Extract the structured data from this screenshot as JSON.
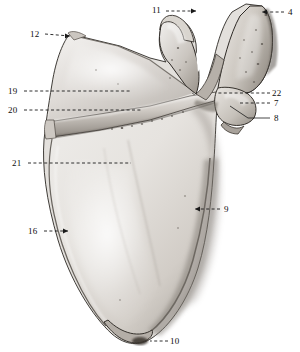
{
  "figure": {
    "background_color": "#ffffff",
    "width": 300,
    "height": 352,
    "label_color": "#0d0d0d",
    "leader_color": "#1a1a1a"
  },
  "labels": [
    {
      "id": "11",
      "text": "11",
      "x": 152,
      "y": 6,
      "leader": {
        "type": "dashed-arrow",
        "x1": 166,
        "y1": 11,
        "x2": 196,
        "y2": 11,
        "arrow": "right"
      }
    },
    {
      "id": "4",
      "text": "4",
      "x": 288,
      "y": 8,
      "leader": {
        "type": "dashed-arrow",
        "x1": 284,
        "y1": 12,
        "x2": 262,
        "y2": 12,
        "arrow": "left"
      }
    },
    {
      "id": "12",
      "text": "12",
      "x": 30,
      "y": 30,
      "leader": {
        "type": "dashed-arrow",
        "x1": 45,
        "y1": 34,
        "x2": 70,
        "y2": 36,
        "arrow": "right"
      }
    },
    {
      "id": "19",
      "text": "19",
      "x": 8,
      "y": 87,
      "leader": {
        "type": "dashed",
        "x1": 24,
        "y1": 91,
        "x2": 130,
        "y2": 91
      }
    },
    {
      "id": "22",
      "text": "22",
      "x": 272,
      "y": 89,
      "leader": {
        "type": "dashed",
        "x1": 270,
        "y1": 93,
        "x2": 218,
        "y2": 93
      }
    },
    {
      "id": "20",
      "text": "20",
      "x": 8,
      "y": 106,
      "leader": {
        "type": "dashed",
        "x1": 24,
        "y1": 110,
        "x2": 142,
        "y2": 110
      }
    },
    {
      "id": "7",
      "text": "7",
      "x": 274,
      "y": 99,
      "leader": {
        "type": "dashed",
        "x1": 270,
        "y1": 103,
        "x2": 240,
        "y2": 103
      }
    },
    {
      "id": "8",
      "text": "8",
      "x": 274,
      "y": 114,
      "leader": {
        "type": "solid-bent",
        "x1": 270,
        "y1": 118,
        "x2": 248,
        "y2": 118,
        "x3": 230,
        "y3": 106
      }
    },
    {
      "id": "21",
      "text": "21",
      "x": 12,
      "y": 159,
      "leader": {
        "type": "dashed",
        "x1": 28,
        "y1": 163,
        "x2": 131,
        "y2": 163
      }
    },
    {
      "id": "9",
      "text": "9",
      "x": 224,
      "y": 205,
      "leader": {
        "type": "dashed-arrow",
        "x1": 220,
        "y1": 209,
        "x2": 195,
        "y2": 209,
        "arrow": "left"
      }
    },
    {
      "id": "16",
      "text": "16",
      "x": 28,
      "y": 227,
      "leader": {
        "type": "dashed-arrow",
        "x1": 44,
        "y1": 231,
        "x2": 68,
        "y2": 231,
        "arrow": "right"
      }
    },
    {
      "id": "10",
      "text": "10",
      "x": 170,
      "y": 337,
      "leader": {
        "type": "dashed",
        "x1": 168,
        "y1": 341,
        "x2": 150,
        "y2": 341
      }
    }
  ]
}
